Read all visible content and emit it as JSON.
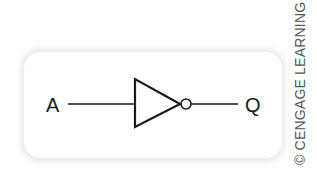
{
  "diagram": {
    "type": "logic-gate",
    "gate": "NOT",
    "input_label": "A",
    "output_label": "Q",
    "stroke_color": "#1a1a1a",
    "background_color": "#ffffff"
  },
  "credit": {
    "text": "© CENGAGE LEARNING"
  }
}
